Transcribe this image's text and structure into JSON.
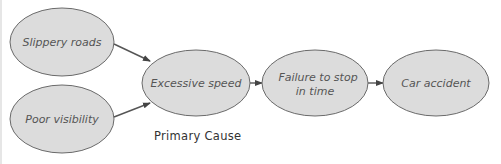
{
  "diagram": {
    "type": "cause-effect flow",
    "nodes": [
      {
        "id": "slippery",
        "lines": [
          "Slippery roads"
        ]
      },
      {
        "id": "visibility",
        "lines": [
          "Poor visibility"
        ]
      },
      {
        "id": "speed",
        "lines": [
          "Excessive speed"
        ]
      },
      {
        "id": "failure",
        "lines": [
          "Failure to stop",
          "in time"
        ]
      },
      {
        "id": "accident",
        "lines": [
          "Car accident"
        ]
      }
    ],
    "edges": [
      {
        "from": "slippery",
        "to": "speed"
      },
      {
        "from": "visibility",
        "to": "speed"
      },
      {
        "from": "speed",
        "to": "failure"
      },
      {
        "from": "failure",
        "to": "accident"
      }
    ],
    "caption": "Primary Cause",
    "colors": {
      "node_fill": "#dcdcdc",
      "node_stroke": "#6a6a6a",
      "arrow": "#444444"
    }
  }
}
